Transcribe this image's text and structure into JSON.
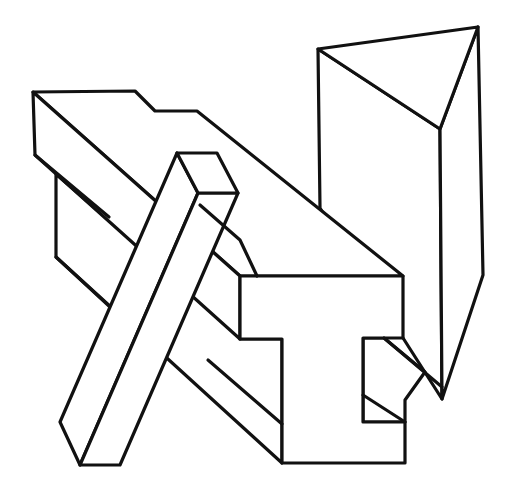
{
  "figure": {
    "background_color": "#ffffff",
    "line_color": "#111111",
    "width": 511,
    "height": 490
  },
  "shapes": [
    {
      "name": "triangular-prism"
    },
    {
      "name": "i-beam"
    },
    {
      "name": "square-post"
    }
  ]
}
